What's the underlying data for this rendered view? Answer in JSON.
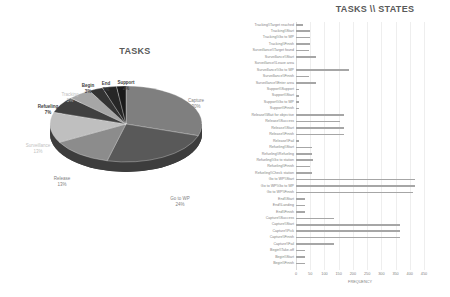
{
  "chart_data": [
    {
      "type": "pie",
      "title": "TASKS",
      "style": "3d",
      "categories": [
        "Capture",
        "Go to WP",
        "Release",
        "Surveillance",
        "Refueling",
        "Tracking",
        "Begin",
        "End",
        "Support"
      ],
      "values": [
        30,
        24,
        13,
        13,
        7,
        5,
        3,
        3,
        2
      ],
      "labels": [
        "30%",
        "24%",
        "13%",
        "13%",
        "7%",
        "5%",
        "3%",
        "3%",
        "2%"
      ],
      "colors": [
        "#7f7f7f",
        "#595959",
        "#8c8c8c",
        "#bfbfbf",
        "#404040",
        "#a6a6a6",
        "#333333",
        "#262626",
        "#1a1a1a"
      ]
    },
    {
      "type": "bar",
      "orientation": "horizontal",
      "title": "TASKS \\\\ STATES",
      "xlabel": "FREQUENCY",
      "ylabel": "",
      "xlim": [
        0,
        450
      ],
      "xticks": [
        "0",
        "50",
        "100",
        "150",
        "200",
        "250",
        "300",
        "350",
        "400",
        "450"
      ],
      "grid": true,
      "categories": [
        "Tracking\\\\Target reached",
        "Tracking\\\\Start",
        "Tracking\\\\Go to WP",
        "Tracking\\\\Finish",
        "Surveillance\\\\Target found",
        "Surveillance\\\\Start",
        "Surveillance\\\\Leave area",
        "Surveillance\\\\Go to WP",
        "Surveillance\\\\Finish",
        "Surveillance\\\\Enter area",
        "Support\\\\Support",
        "Support\\\\Start",
        "Support\\\\Go to WP",
        "Support\\\\Finish",
        "Release\\\\Wait for objective",
        "Release\\\\Success",
        "Release\\\\Start",
        "Release\\\\Finish",
        "Release\\\\Fail",
        "Refueling\\\\Start",
        "Refueling\\\\Refueling",
        "Refueling\\\\Go to station",
        "Refueling\\\\Finish",
        "Refueling\\\\Check station",
        "Go to WP\\\\Start",
        "Go to WP\\\\Go to WP",
        "Go to WP\\\\Finish",
        "End\\\\Start",
        "End\\\\Landing",
        "End\\\\Finish",
        "Capture\\\\Success",
        "Capture\\\\Start",
        "Capture\\\\Pick",
        "Capture\\\\Finish",
        "Capture\\\\Fail",
        "Begin\\\\Take-off",
        "Begin\\\\Start",
        "Begin\\\\Finish"
      ],
      "values": [
        25,
        50,
        50,
        50,
        45,
        70,
        0,
        185,
        45,
        70,
        10,
        10,
        10,
        10,
        170,
        155,
        170,
        170,
        10,
        55,
        55,
        60,
        50,
        55,
        420,
        420,
        410,
        30,
        30,
        30,
        135,
        365,
        365,
        365,
        135,
        30,
        30,
        30
      ],
      "bar_color": "#a6a6a6"
    }
  ]
}
